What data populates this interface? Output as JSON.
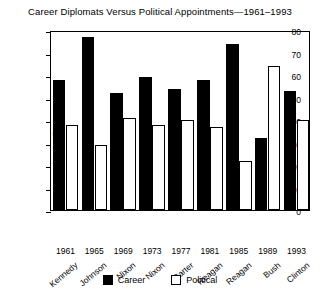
{
  "chart_data": {
    "type": "bar",
    "title": "Career Diplomats Versus Political Appointments—1961–1993",
    "xlabel": "",
    "ylabel": "Percent",
    "ylim": [
      0,
      80
    ],
    "yticks": [
      0,
      10,
      20,
      30,
      40,
      50,
      60,
      70,
      80
    ],
    "grid": false,
    "legend_position": "bottom-center",
    "categories": [
      "1961",
      "1965",
      "1969",
      "1973",
      "1977",
      "1981",
      "1985",
      "1989",
      "1993"
    ],
    "category_names": [
      "Kennedy",
      "Johnson",
      "Nixon",
      "Nixon",
      "Carter",
      "Reagan",
      "Reagan",
      "Bush",
      "Clinton"
    ],
    "series": [
      {
        "name": "Career",
        "color": "#000000",
        "values": [
          58,
          77,
          52,
          59,
          54,
          58,
          74,
          32,
          53
        ]
      },
      {
        "name": "Political",
        "color": "#ffffff",
        "values": [
          38,
          29,
          41,
          38,
          40,
          37,
          22,
          64,
          40
        ]
      }
    ]
  }
}
